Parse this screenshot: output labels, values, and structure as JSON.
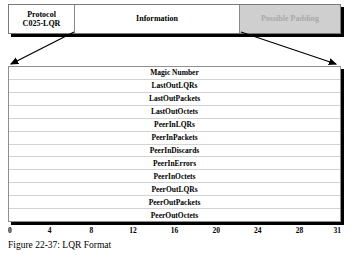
{
  "figure": {
    "caption": "Figure 22-37: LQR Format"
  },
  "packet_bar": {
    "cells": [
      {
        "label": "Protocol\nC025-LQR",
        "name": "protocol"
      },
      {
        "label": "Information",
        "name": "information"
      },
      {
        "label": "Possible Padding",
        "name": "possible-padding"
      }
    ],
    "padding_color": "#cfcfcf",
    "padding_text_color": "#a9a9a9"
  },
  "fields": [
    "Magic Number",
    "LastOutLQRs",
    "LastOutPackets",
    "LastOutOctets",
    "PeerInLQRs",
    "PeerInPackets",
    "PeerInDiscards",
    "PeerInErrors",
    "PeerInOctets",
    "PeerOutLQRs",
    "PeerOutPackets",
    "PeerOutOctets"
  ],
  "bit_ruler": {
    "ticks": [
      "0",
      "4",
      "8",
      "12",
      "16",
      "20",
      "24",
      "28",
      "31"
    ],
    "positions": [
      0,
      12.5,
      25,
      37.5,
      50,
      62.5,
      75,
      87.5,
      100
    ]
  }
}
